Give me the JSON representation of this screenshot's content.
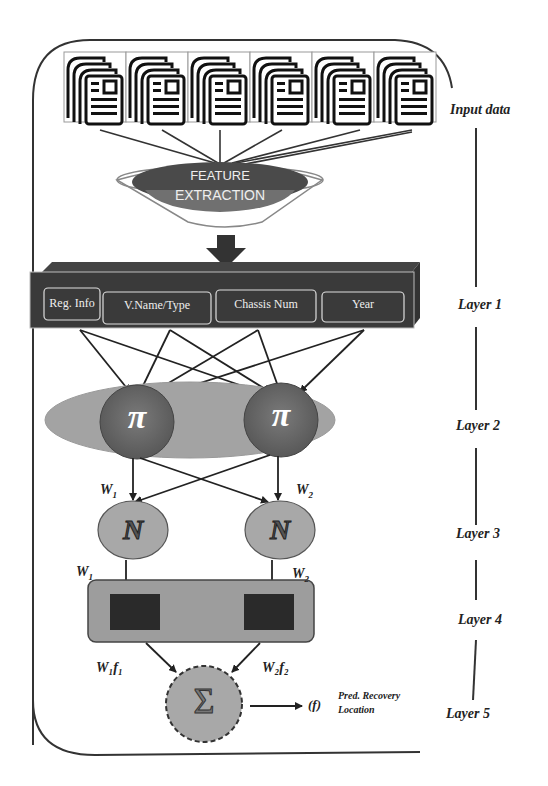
{
  "diagram": {
    "input_label": "Input data",
    "document_count": 6,
    "feature_extraction": {
      "line1": "FEATURE",
      "line2": "EXTRACTION"
    },
    "layer1": {
      "label": "Layer 1",
      "cells": [
        "Reg. Info",
        "V.Name/Type",
        "Chassis Num",
        "Year"
      ]
    },
    "layer2": {
      "label": "Layer 2",
      "nodes": [
        "π",
        "π"
      ]
    },
    "weights_top": {
      "w1": "W",
      "w1_sub": "1",
      "w2": "W",
      "w2_sub": "2"
    },
    "layer3": {
      "label": "Layer 3",
      "nodes": [
        "N",
        "N"
      ]
    },
    "weights_mid": {
      "w1": "W",
      "w1_sub": "1",
      "w2": "W",
      "w2_sub": "2"
    },
    "layer4": {
      "label": "Layer 4"
    },
    "weights_bottom": {
      "w1f1": "W₁f₁",
      "w2f2": "W₂f₂"
    },
    "layer5": {
      "label": "Layer 5",
      "node": "Σ",
      "output_symbol": "(f)",
      "output_line1": "Pred. Recovery",
      "output_line2": "Location"
    }
  },
  "colors": {
    "dark": "#3a3a3a",
    "mid": "#6b6b6b",
    "light": "#a8a8a8",
    "lighter": "#c4c4c4",
    "line": "#222222"
  }
}
